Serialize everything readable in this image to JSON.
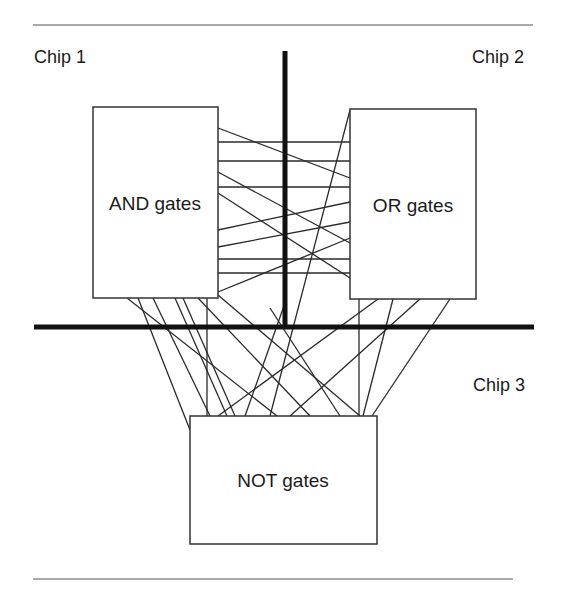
{
  "diagram": {
    "chips": [
      {
        "id": "chip1",
        "label": "Chip 1",
        "x": 34,
        "y": 57
      },
      {
        "id": "chip2",
        "label": "Chip 2",
        "x": 472,
        "y": 57
      },
      {
        "id": "chip3",
        "label": "Chip 3",
        "x": 473,
        "y": 377
      }
    ],
    "boxes": [
      {
        "id": "and",
        "label": "AND gates",
        "x": 93,
        "y": 107,
        "w": 125,
        "h": 191
      },
      {
        "id": "or",
        "label": "OR gates",
        "x": 350,
        "y": 109,
        "w": 126,
        "h": 190
      },
      {
        "id": "not",
        "label": "NOT gates",
        "x": 190,
        "y": 416,
        "w": 187,
        "h": 128
      }
    ],
    "rules": [
      {
        "x1": 33,
        "y1": 25,
        "x2": 533,
        "y2": 25
      },
      {
        "x1": 33,
        "y1": 579,
        "x2": 513,
        "y2": 579
      }
    ],
    "dividers": [
      {
        "x1": 285,
        "y1": 51,
        "x2": 285,
        "y2": 326
      },
      {
        "x1": 34,
        "y1": 327,
        "x2": 534,
        "y2": 327
      }
    ],
    "wires": [
      [
        218,
        142,
        350,
        142
      ],
      [
        218,
        161,
        350,
        161
      ],
      [
        218,
        187,
        350,
        187
      ],
      [
        218,
        259,
        350,
        259
      ],
      [
        218,
        273,
        350,
        273
      ],
      [
        218,
        128,
        350,
        178
      ],
      [
        218,
        172,
        350,
        243
      ],
      [
        218,
        193,
        350,
        278
      ],
      [
        218,
        230,
        350,
        202
      ],
      [
        218,
        247,
        350,
        222
      ],
      [
        218,
        292,
        350,
        238
      ],
      [
        350,
        110,
        270,
        416
      ],
      [
        127,
        298,
        277,
        416
      ],
      [
        138,
        298,
        190,
        430
      ],
      [
        153,
        298,
        210,
        416
      ],
      [
        175,
        298,
        227,
        416
      ],
      [
        183,
        298,
        235,
        416
      ],
      [
        207,
        298,
        207,
        416
      ],
      [
        198,
        298,
        310,
        416
      ],
      [
        218,
        295,
        360,
        416
      ],
      [
        270,
        308,
        340,
        416
      ],
      [
        285,
        303,
        245,
        416
      ],
      [
        359,
        299,
        359,
        416
      ],
      [
        378,
        299,
        218,
        416
      ],
      [
        393,
        299,
        363,
        416
      ],
      [
        420,
        299,
        290,
        416
      ],
      [
        450,
        299,
        372,
        416
      ]
    ]
  }
}
